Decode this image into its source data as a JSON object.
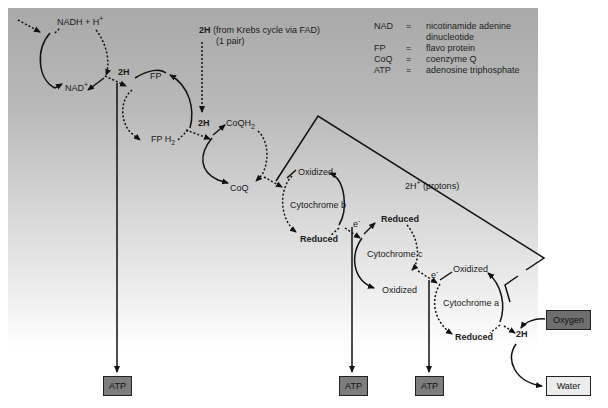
{
  "diagram": {
    "type": "electron-transport-chain",
    "colors": {
      "panel_top": "#a9a9a9",
      "panel_bottom": "#ffffff",
      "atp_box": "#7d7d7d",
      "oxygen_box": "#6e6e6e",
      "water_box": "#ececec",
      "stroke": "#111111"
    },
    "inputs": {
      "nadh": "NADH + H",
      "nadh_sup": "+",
      "krebs_bold": "2H",
      "krebs_text": " (from Krebs cycle via FAD)",
      "krebs_pair": "(1 pair)"
    },
    "cycles": {
      "nad": {
        "product": "NAD",
        "product_sup": "+",
        "transfer": "2H"
      },
      "fp": {
        "oxidized": "FP",
        "reduced": "FP H",
        "reduced_sub": "2",
        "transfer": "2H"
      },
      "coq": {
        "oxidized": "CoQ",
        "reduced": "CoQH",
        "reduced_sub": "2"
      },
      "cyt_b": {
        "name": "Cytochrome b",
        "oxidized": "Oxidized",
        "reduced": "Reduced",
        "transfer": "e",
        "transfer_sup": "-"
      },
      "cyt_c": {
        "name": "Cytochrome c",
        "oxidized": "Oxidized",
        "reduced": "Reduced",
        "transfer": "e",
        "transfer_sup": "-"
      },
      "cyt_a": {
        "name": "Cytochrome a",
        "oxidized": "Oxidized",
        "reduced": "Reduced"
      }
    },
    "protons": {
      "label": "2H",
      "sup": "+",
      "suffix": " (protons)"
    },
    "final": {
      "two_h": "2H",
      "oxygen": "Oxygen",
      "water": "Water"
    },
    "atp_boxes": [
      {
        "label": "ATP"
      },
      {
        "label": "ATP"
      },
      {
        "label": "ATP"
      }
    ],
    "legend": [
      {
        "abbr": "NAD",
        "eq": "=",
        "def": "nicotinamide adenine",
        "def2": "dinucleotide"
      },
      {
        "abbr": "FP",
        "eq": "=",
        "def": "flavo protein"
      },
      {
        "abbr": "CoQ",
        "eq": "=",
        "def": "coenzyme Q"
      },
      {
        "abbr": "ATP",
        "eq": "=",
        "def": "adenosine triphosphate"
      }
    ]
  }
}
